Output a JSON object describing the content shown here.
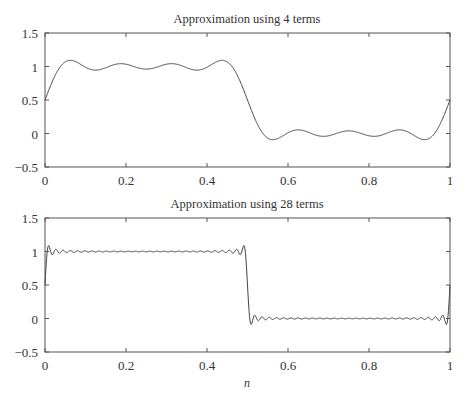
{
  "figure": {
    "xlabel": "n"
  },
  "chart_data": [
    {
      "type": "line",
      "title": "Approximation using 4 terms",
      "xlabel": "",
      "ylabel": "",
      "xlim": [
        0,
        1
      ],
      "ylim": [
        -0.5,
        1.5
      ],
      "xticks": [
        "0",
        "0.2",
        "0.4",
        "0.6",
        "0.8",
        "1"
      ],
      "yticks": [
        "1.5",
        "1",
        "0.5",
        "0",
        "−0.5"
      ],
      "grid": false,
      "legend": null,
      "series": [
        {
          "name": "Fourier approximation (4 terms)",
          "terms": 4,
          "x": [
            0,
            0.06,
            0.13,
            0.19,
            0.25,
            0.31,
            0.38,
            0.44,
            0.5,
            0.56,
            0.62,
            0.69,
            0.75,
            0.81,
            0.88,
            0.94,
            1.0
          ],
          "y": [
            0.5,
            1.07,
            0.94,
            1.04,
            0.95,
            1.04,
            0.94,
            1.09,
            0.5,
            -0.09,
            0.06,
            -0.04,
            0.05,
            -0.04,
            0.06,
            -0.09,
            0.5
          ]
        }
      ]
    },
    {
      "type": "line",
      "title": "Approximation using 28 terms",
      "xlabel": "n",
      "ylabel": "",
      "xlim": [
        0,
        1
      ],
      "ylim": [
        -0.5,
        1.5
      ],
      "xticks": [
        "0",
        "0.2",
        "0.4",
        "0.6",
        "0.8",
        "1"
      ],
      "yticks": [
        "1.5",
        "1",
        "0.5",
        "0",
        "−0.5"
      ],
      "grid": false,
      "legend": null,
      "series": [
        {
          "name": "Fourier approximation (28 terms)",
          "terms": 28,
          "x": [
            0,
            0.06,
            0.13,
            0.19,
            0.25,
            0.31,
            0.38,
            0.44,
            0.5,
            0.56,
            0.62,
            0.69,
            0.75,
            0.81,
            0.88,
            0.94,
            1.0
          ],
          "y": [
            0.5,
            1.1,
            0.95,
            1.05,
            0.96,
            1.05,
            0.95,
            1.1,
            0.5,
            -0.1,
            0.07,
            -0.03,
            0.05,
            -0.03,
            0.07,
            -0.1,
            0.5
          ]
        }
      ]
    }
  ]
}
